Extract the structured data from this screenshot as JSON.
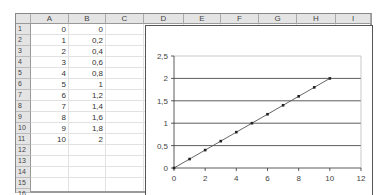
{
  "spreadsheet": {
    "columns": [
      "A",
      "B",
      "C",
      "D",
      "E",
      "F",
      "G",
      "H",
      "I"
    ],
    "rows": [
      "1",
      "2",
      "3",
      "4",
      "5",
      "6",
      "7",
      "8",
      "9",
      "10",
      "11",
      "12",
      "13",
      "14",
      "15",
      "16"
    ],
    "cells": {
      "A": [
        "0",
        "1",
        "2",
        "3",
        "4",
        "5",
        "6",
        "7",
        "8",
        "9",
        "10"
      ],
      "B": [
        "0",
        "0,2",
        "0,4",
        "0,6",
        "0,8",
        "1",
        "1,2",
        "1,4",
        "1,6",
        "1,8",
        "2"
      ]
    }
  },
  "chart_data": {
    "type": "line",
    "x": [
      0,
      1,
      2,
      3,
      4,
      5,
      6,
      7,
      8,
      9,
      10
    ],
    "series": [
      {
        "name": "B",
        "values": [
          0,
          0.2,
          0.4,
          0.6,
          0.8,
          1,
          1.2,
          1.4,
          1.6,
          1.8,
          2
        ]
      }
    ],
    "title": "",
    "xlabel": "",
    "ylabel": "",
    "xlim": [
      0,
      12
    ],
    "ylim": [
      0,
      2.5
    ],
    "x_ticks": [
      "0",
      "2",
      "4",
      "6",
      "8",
      "10",
      "12"
    ],
    "y_ticks": [
      "0",
      "0,5",
      "1",
      "1,5",
      "2",
      "2,5"
    ],
    "grid": "horizontal major gridlines",
    "legend": "none",
    "colors": {
      "line": "#555555",
      "marker": "#222222",
      "grid": "#333333"
    }
  }
}
